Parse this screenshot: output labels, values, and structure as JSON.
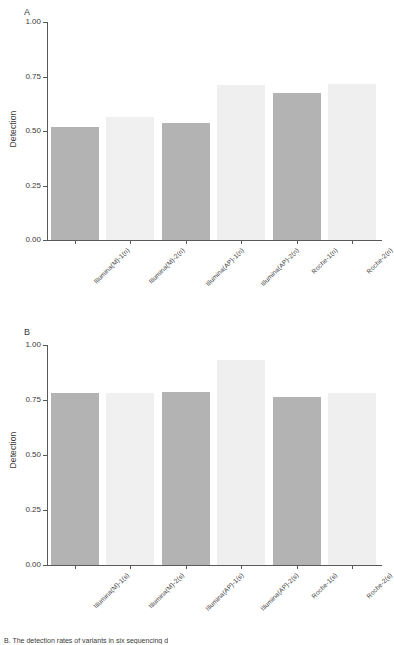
{
  "figure": {
    "background_color": "#ffffff",
    "axis_color": "#595959",
    "text_color": "#3a3a3a",
    "caption": "B. The detection rates of variants in six sequencing d"
  },
  "panels": [
    {
      "letter": "A",
      "ylabel": "Detection"
    },
    {
      "letter": "B",
      "ylabel": "Detection"
    }
  ],
  "chart_data": [
    {
      "type": "bar",
      "panel": "A",
      "title": "",
      "subtitle": "",
      "xlabel": "",
      "ylabel": "Detection",
      "ylim": [
        0.0,
        1.0
      ],
      "yticks": [
        "0.00",
        "0.25",
        "0.50",
        "0.75",
        "1.00"
      ],
      "ytick_values": [
        0.0,
        0.25,
        0.5,
        0.75,
        1.0
      ],
      "grid": false,
      "legend": "none",
      "categories": [
        "Illumina(M)-1(n)",
        "Illumina(M)-2(n)",
        "Illumina(AP)-1(n)",
        "Illumina(AP)-2(n)",
        "Roche-1(n)",
        "Roche-2(n)"
      ],
      "values": [
        0.52,
        0.565,
        0.535,
        0.71,
        0.675,
        0.715
      ],
      "bar_colors": [
        "#b3b3b3",
        "#f0f0f0",
        "#b3b3b3",
        "#efefef",
        "#b3b3b3",
        "#efefef"
      ]
    },
    {
      "type": "bar",
      "panel": "B",
      "title": "",
      "subtitle": "",
      "xlabel": "",
      "ylabel": "Detection",
      "ylim": [
        0.0,
        1.0
      ],
      "yticks": [
        "0.00",
        "0.25",
        "0.50",
        "0.75",
        "1.00"
      ],
      "ytick_values": [
        0.0,
        0.25,
        0.5,
        0.75,
        1.0
      ],
      "grid": false,
      "legend": "none",
      "categories": [
        "Illumina(M)-1(s)",
        "Illumina(M)-2(s)",
        "Illumina(AP)-1(s)",
        "Illumina(AP)-2(s)",
        "Roche-1(s)",
        "Roche-2(s)"
      ],
      "values": [
        0.78,
        0.78,
        0.785,
        0.93,
        0.765,
        0.78
      ],
      "bar_colors": [
        "#b3b3b3",
        "#f0f0f0",
        "#b3b3b3",
        "#efefef",
        "#b3b3b3",
        "#efefef"
      ]
    }
  ]
}
